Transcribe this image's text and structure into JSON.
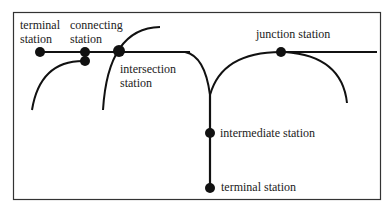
{
  "diagram": {
    "colors": {
      "line": "#111111",
      "frame": "#333333",
      "text": "#222222",
      "background": "#ffffff"
    },
    "labels": {
      "terminal_top_line1": "terminal",
      "terminal_top_line2": "station",
      "connecting_line1": "connecting",
      "connecting_line2": "station",
      "intersection_line1": "intersection",
      "intersection_line2": "station",
      "junction": "junction station",
      "intermediate": "intermediate station",
      "terminal_bottom": "terminal station"
    },
    "stations": [
      {
        "id": "terminal-top",
        "x": 40,
        "y": 52
      },
      {
        "id": "connecting-a",
        "x": 85,
        "y": 52
      },
      {
        "id": "connecting-b",
        "x": 85,
        "y": 61
      },
      {
        "id": "intersection",
        "x": 119,
        "y": 51
      },
      {
        "id": "junction",
        "x": 281,
        "y": 52
      },
      {
        "id": "intermediate",
        "x": 210,
        "y": 133
      },
      {
        "id": "terminal-bottom",
        "x": 210,
        "y": 188
      }
    ]
  }
}
